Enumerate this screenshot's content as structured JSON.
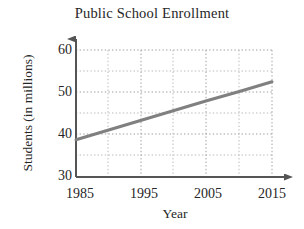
{
  "chart_data": {
    "type": "line",
    "title": "Public School Enrollment",
    "xlabel": "Year",
    "ylabel": "Students (in millions)",
    "xlim": [
      1985,
      2015
    ],
    "ylim": [
      30,
      60
    ],
    "grid": true,
    "grid_style": "dotted",
    "legend": "none",
    "xticks": [
      1985,
      1995,
      2005,
      2015
    ],
    "xtick_labels": [
      "1985",
      "1995",
      "2005",
      "2015"
    ],
    "yticks": [
      30,
      40,
      50,
      60
    ],
    "ytick_labels": [
      "30",
      "40",
      "50",
      "60"
    ],
    "x_minor_gridlines": [
      1990,
      2000,
      2010
    ],
    "y_minor_gridlines": [
      35,
      45,
      55
    ],
    "series": [
      {
        "name": "Public school enrollment",
        "color": "#808080",
        "line_width": 3,
        "x": [
          1985,
          1990,
          1995,
          2000,
          2005,
          2010,
          2015
        ],
        "values": [
          38.8,
          41.1,
          43.4,
          45.7,
          48.0,
          50.2,
          52.5
        ]
      }
    ],
    "annotations": []
  },
  "axes": {
    "x_arrow": "right-arrow-icon",
    "y_arrow": "up-arrow-icon",
    "axis_color": "#555555"
  }
}
